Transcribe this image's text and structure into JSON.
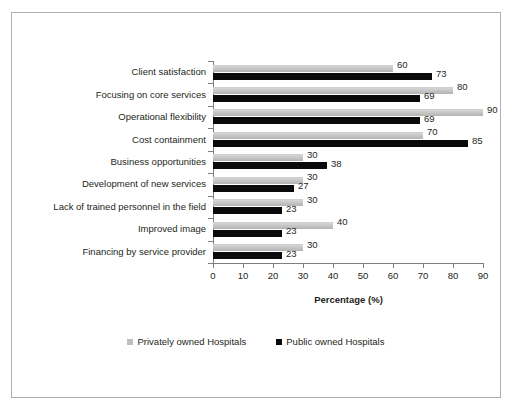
{
  "chart_data": {
    "type": "bar",
    "orientation": "horizontal",
    "title": "",
    "xlabel": "Percentage (%)",
    "ylabel": "",
    "xlim": [
      0,
      90
    ],
    "xticks": [
      0,
      10,
      20,
      30,
      40,
      50,
      60,
      70,
      80,
      90
    ],
    "grid": false,
    "legend_position": "bottom-center",
    "categories": [
      "Client satisfaction",
      "Focusing on core services",
      "Operational flexibility",
      "Cost containment",
      "Business opportunities",
      "Development of new services",
      "Lack of trained personnel in the field",
      "Improved image",
      "Financing by service provider"
    ],
    "series": [
      {
        "name": "Privately owned Hospitals",
        "color": "#bfbfbf",
        "values": [
          60,
          80,
          90,
          70,
          30,
          30,
          30,
          40,
          30
        ]
      },
      {
        "name": "Public owned Hospitals",
        "color": "#0a0a0a",
        "values": [
          73,
          69,
          69,
          85,
          38,
          27,
          23,
          23,
          23
        ]
      }
    ]
  },
  "legend": {
    "entries": [
      {
        "label": "Privately owned Hospitals",
        "swatch": "gray-square-icon"
      },
      {
        "label": "Public owned Hospitals",
        "swatch": "black-square-icon"
      }
    ]
  }
}
